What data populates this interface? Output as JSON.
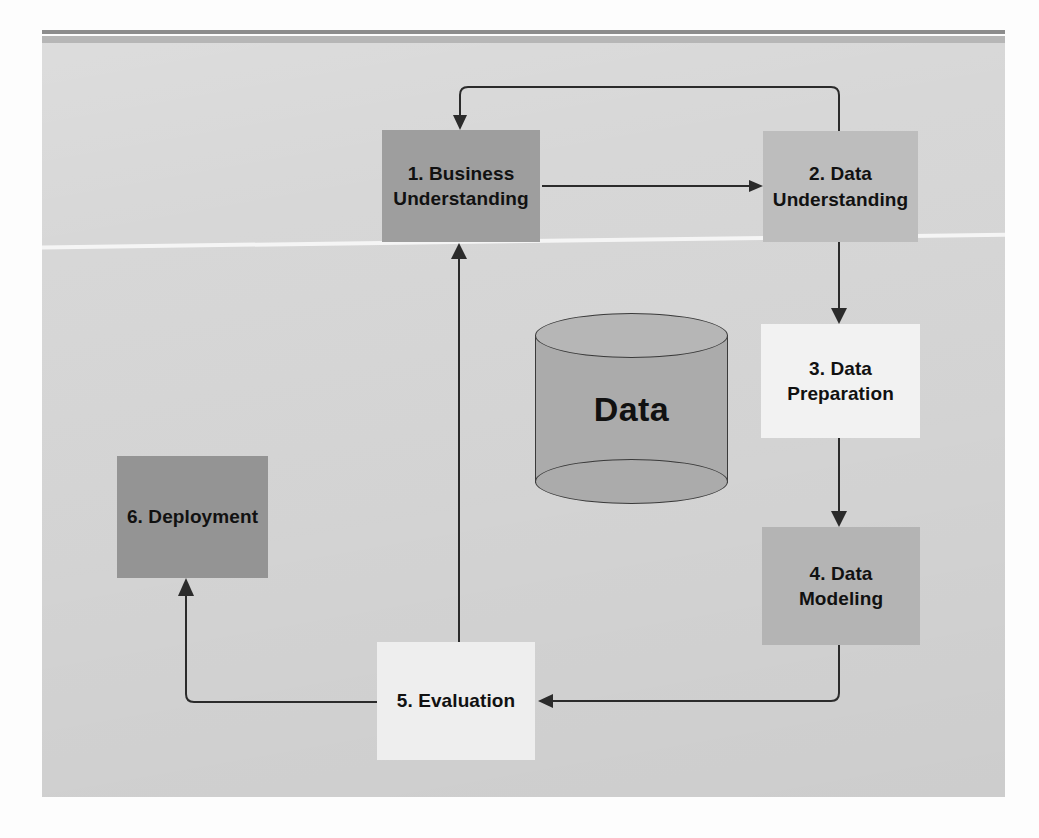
{
  "diagram": {
    "type": "flowchart",
    "panel_background": "#d6d6d6",
    "nodes": [
      {
        "id": "business-understanding",
        "label": "1. Business Understanding",
        "line1": "1. Business",
        "line2": "Understanding",
        "color": "#9e9e9e"
      },
      {
        "id": "data-understanding",
        "label": "2. Data Understanding",
        "line1": "2. Data",
        "line2": "Understanding",
        "color": "#bdbdbd"
      },
      {
        "id": "data-preparation",
        "label": "3. Data Preparation",
        "line1": "3. Data",
        "line2": "Preparation",
        "color": "#f2f2f2"
      },
      {
        "id": "data-modeling",
        "label": "4. Data Modeling",
        "line1": "4. Data Modeling",
        "line2": "",
        "color": "#b4b4b4"
      },
      {
        "id": "evaluation",
        "label": "5. Evaluation",
        "line1": "5. Evaluation",
        "line2": "",
        "color": "#eeeeee"
      },
      {
        "id": "deployment",
        "label": "6. Deployment",
        "line1": "6. Deployment",
        "line2": "",
        "color": "#949494"
      }
    ],
    "datastore": {
      "id": "data-cylinder",
      "label": "Data",
      "shape": "cylinder",
      "color": "#ababab"
    },
    "edges": [
      {
        "from": "1. Business Understanding",
        "to": "2. Data Understanding",
        "style": "straight-horizontal"
      },
      {
        "from": "2. Data Understanding",
        "to": "1. Business Understanding",
        "style": "feedback-loop-top"
      },
      {
        "from": "2. Data Understanding",
        "to": "3. Data Preparation",
        "style": "straight-vertical"
      },
      {
        "from": "3. Data Preparation",
        "to": "4. Data Modeling",
        "style": "straight-vertical"
      },
      {
        "from": "4. Data Modeling",
        "to": "5. Evaluation",
        "style": "elbow-bottom-left"
      },
      {
        "from": "5. Evaluation",
        "to": "1. Business Understanding",
        "style": "straight-vertical-up"
      },
      {
        "from": "5. Evaluation",
        "to": "6. Deployment",
        "style": "elbow-left-up"
      }
    ],
    "stroke_color": "#2b2b2b",
    "text_color": "#111111"
  }
}
